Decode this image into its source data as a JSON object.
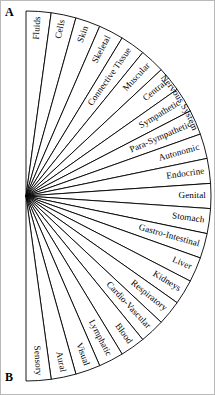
{
  "figure": {
    "panel_a_label": "A",
    "panel_b_label": "B",
    "description_type": "radial-fan-sector-diagram",
    "sector_count": 22,
    "colors": {
      "background": "#ffffff",
      "stroke": "#000000",
      "text": "#000000",
      "frame": "#b9b9b9"
    },
    "geometry": {
      "apex_x": 26,
      "apex_y": 196,
      "radius": 185,
      "start_angle_deg": -90,
      "end_angle_deg": 90
    }
  },
  "sectors": [
    {
      "index": 1,
      "label": "Fluids"
    },
    {
      "index": 2,
      "label": "Cells"
    },
    {
      "index": 3,
      "label": "Skin"
    },
    {
      "index": 4,
      "label": "Skeletal"
    },
    {
      "index": 5,
      "label": "Connective Tissue"
    },
    {
      "index": 6,
      "label": "Muscular"
    },
    {
      "index": 7,
      "label": "Central"
    },
    {
      "index": 8,
      "label": "Sympathetic"
    },
    {
      "index": 9,
      "label": "Para-Sympathetic"
    },
    {
      "index": 10,
      "label": "Autonomic"
    },
    {
      "index": 11,
      "label": "Endocrine"
    },
    {
      "index": 12,
      "label": "Genital"
    },
    {
      "index": 13,
      "label": "Stomach"
    },
    {
      "index": 14,
      "label": "Gastro-Intestinal"
    },
    {
      "index": 15,
      "label": "Liver"
    },
    {
      "index": 16,
      "label": "Kidneys"
    },
    {
      "index": 17,
      "label": "Respiratory"
    },
    {
      "index": 18,
      "label": "Cardio-Vascular"
    },
    {
      "index": 19,
      "label": "Blood"
    },
    {
      "index": 20,
      "label": "Lymphatic"
    },
    {
      "index": 21,
      "label": "Visual"
    },
    {
      "index": 22,
      "label": "Aural"
    },
    {
      "index": 23,
      "label": "Sensory"
    }
  ],
  "arc_labels": [
    {
      "index": 1,
      "label": "Nervous System",
      "spans_sectors": [
        7,
        8,
        9
      ],
      "position": "outer-arc"
    }
  ]
}
